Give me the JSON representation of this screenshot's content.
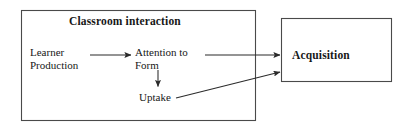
{
  "diagram": {
    "type": "flow-diagram",
    "title": "Classroom interaction",
    "containers": [
      {
        "id": "classroom-interaction",
        "label": "Classroom interaction",
        "bold": true,
        "x": 21,
        "y": 10,
        "width": 235,
        "height": 111
      },
      {
        "id": "acquisition",
        "label": "Acquisition",
        "bold": true,
        "x": 281,
        "y": 18,
        "width": 111,
        "height": 64
      }
    ],
    "nodes": [
      {
        "id": "learner-production",
        "label": "Learner\nProduction",
        "lines": [
          "Learner",
          "Production"
        ],
        "x": 30,
        "y": 46
      },
      {
        "id": "attention-to-form",
        "label": "Attention to\nForm",
        "lines": [
          "Attention to",
          "Form"
        ],
        "x": 135,
        "y": 46
      },
      {
        "id": "uptake",
        "label": "Uptake",
        "lines": [
          "Uptake"
        ],
        "x": 139,
        "y": 91
      },
      {
        "id": "acquisition-node",
        "label": "Acquisition",
        "lines": [
          "Acquisition"
        ],
        "x": 292,
        "y": 49
      }
    ],
    "edges": [
      {
        "id": "learner-production-to-attention",
        "from": "learner-production",
        "to": "attention-to-form",
        "style": "solid-arrow",
        "x1": 90,
        "y1": 55,
        "x2": 132,
        "y2": 55
      },
      {
        "id": "attention-to-acquisition",
        "from": "attention-to-form",
        "to": "acquisition",
        "style": "solid-arrow",
        "x1": 205,
        "y1": 55,
        "x2": 279,
        "y2": 55
      },
      {
        "id": "attention-to-uptake",
        "from": "attention-to-form",
        "to": "uptake",
        "style": "solid-arrow",
        "x1": 158,
        "y1": 70,
        "x2": 158,
        "y2": 87
      },
      {
        "id": "uptake-to-acquisition",
        "from": "uptake",
        "to": "acquisition",
        "style": "solid-arrow",
        "x1": 176,
        "y1": 98,
        "x2": 279,
        "y2": 72
      }
    ],
    "colors": {
      "stroke": "#2b2b2b",
      "box_border": "#3d3d3d",
      "text": "#171717",
      "background": "#ffffff"
    }
  }
}
